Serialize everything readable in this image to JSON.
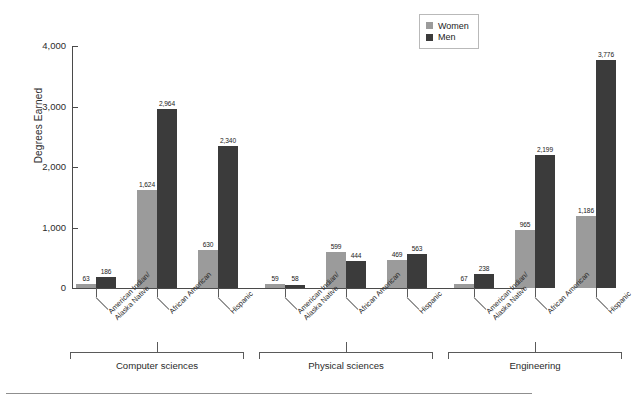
{
  "chart_data": {
    "type": "bar",
    "title": "",
    "xlabel": "",
    "ylabel": "Degrees Earned",
    "ylim": [
      0,
      4000
    ],
    "ytick_labels": [
      "0",
      "1,000",
      "2,000",
      "3,000",
      "4,000"
    ],
    "ytick_values": [
      0,
      1000,
      2000,
      3000,
      4000
    ],
    "grid": false,
    "legend_position": "top-right",
    "legend": [
      "Women",
      "Men"
    ],
    "groups": [
      "Computer sciences",
      "Physical sciences",
      "Engineering"
    ],
    "categories": [
      "American Indian/\nAlaska Native",
      "African American",
      "Hispanic",
      "American Indian/\nAlaska Native",
      "African American",
      "Hispanic",
      "American Indian/\nAlaska Native",
      "African American",
      "Hispanic"
    ],
    "series": [
      {
        "name": "Women",
        "color": "#9b9b9b",
        "values": [
          63,
          1624,
          630,
          59,
          599,
          469,
          67,
          965,
          1186
        ]
      },
      {
        "name": "Men",
        "color": "#3b3b3b",
        "values": [
          186,
          2964,
          2340,
          58,
          444,
          563,
          238,
          2199,
          3776
        ]
      }
    ],
    "value_labels": {
      "women": [
        "63",
        "1,624",
        "630",
        "59",
        "599",
        "469",
        "67",
        "965",
        "1,186"
      ],
      "men": [
        "186",
        "2,964",
        "2,340",
        "58",
        "444",
        "563",
        "238",
        "2,199",
        "3,776"
      ]
    }
  },
  "colors": {
    "women": "#9b9b9b",
    "men": "#3b3b3b",
    "axis": "#4a4a4a",
    "text": "#231f20",
    "rule": "#8f8f8f"
  },
  "category_lines": [
    [
      "American Indian/",
      "Alaska Native"
    ],
    [
      "African American",
      ""
    ],
    [
      "Hispanic",
      ""
    ],
    [
      "American Indian/",
      "Alaska Native"
    ],
    [
      "African American",
      ""
    ],
    [
      "Hispanic",
      ""
    ],
    [
      "American Indian/",
      "Alaska Native"
    ],
    [
      "African American",
      ""
    ],
    [
      "Hispanic",
      ""
    ]
  ]
}
